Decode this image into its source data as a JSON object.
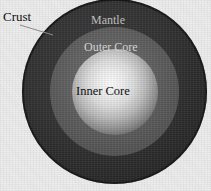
{
  "diagram": {
    "type": "concentric-circles",
    "background_color": "#ececec",
    "layers": [
      {
        "key": "crust",
        "label": "Crust",
        "label_color": "#101010",
        "fill_color": "#1b1b1b",
        "label_placement": "outside-left-with-leader"
      },
      {
        "key": "mantle",
        "label": "Mantle",
        "label_color": "#bdbdbd",
        "fill_color": "#333333",
        "label_placement": "inside-top"
      },
      {
        "key": "outer_core",
        "label": "Outer Core",
        "label_color": "#d2d2d2",
        "fill_color": "#626262",
        "label_placement": "inside-top"
      },
      {
        "key": "inner_core",
        "label": "Inner Core",
        "label_color": "#101010",
        "fill_color": "#fdfdfd",
        "label_placement": "center"
      }
    ],
    "leader_line": {
      "name": "crust-leader-line",
      "color": "#8a8a8a",
      "from_x": 20,
      "from_y": 25,
      "to_x": 53,
      "to_y": 35
    }
  }
}
